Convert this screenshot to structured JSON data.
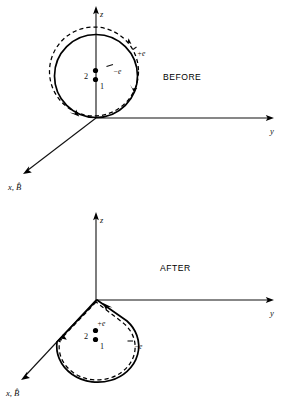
{
  "figure": {
    "background_color": "#ffffff",
    "ink_color": "#000000",
    "width": 284,
    "height": 409
  },
  "panels": [
    {
      "id": "before",
      "phase_label": "BEFORE",
      "axes": {
        "z": {
          "label": "z",
          "direction": "up"
        },
        "y": {
          "label": "y",
          "direction": "right"
        },
        "x": {
          "label": "x, B̂",
          "direction": "down-left"
        }
      },
      "orbit": {
        "shape": "circle",
        "solid_curve_label": "−e",
        "dashed_curve_label": "+e",
        "tangent_point": "origin"
      },
      "particles": [
        {
          "label": "2",
          "label_side": "left"
        },
        {
          "label": "1",
          "label_side": "right"
        }
      ]
    },
    {
      "id": "after",
      "phase_label": "AFTER",
      "axes": {
        "z": {
          "label": "z",
          "direction": "up"
        },
        "y": {
          "label": "y",
          "direction": "right"
        },
        "x": {
          "label": "x, B̂",
          "direction": "down-left"
        }
      },
      "orbit": {
        "shape": "d-loop",
        "solid_curve_label": "+e",
        "dashed_curve_label": "−e",
        "tangent_point": "origin"
      },
      "particles": [
        {
          "label": "2",
          "label_side": "left"
        },
        {
          "label": "1",
          "label_side": "right"
        }
      ]
    }
  ]
}
